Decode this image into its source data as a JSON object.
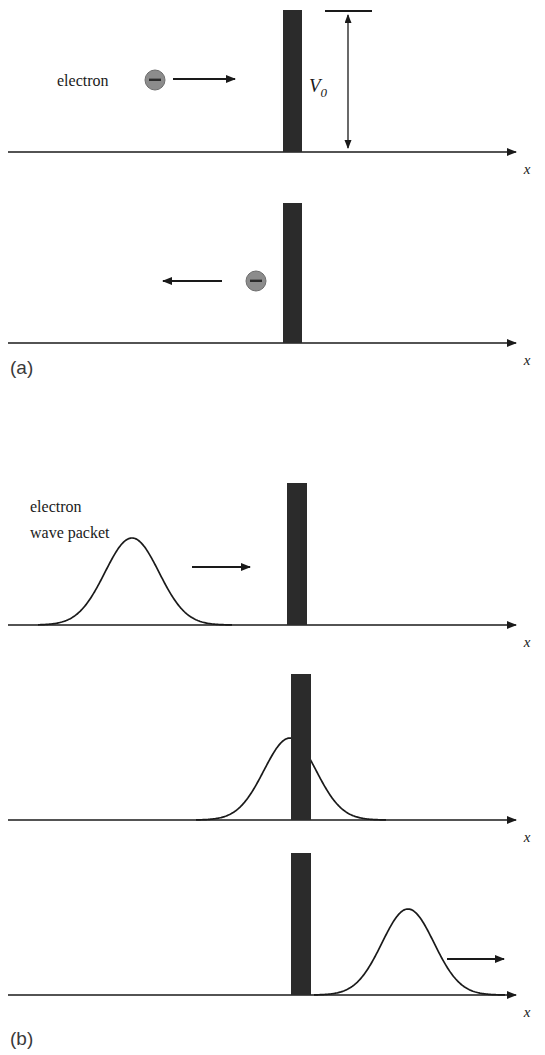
{
  "figure": {
    "colors": {
      "barrier": "#2b2b2b",
      "axis": "#1a1a1a",
      "curve": "#1a1a1a",
      "electron_fill": "#8c8c8c",
      "electron_stroke": "#6e6e6e",
      "electron_sign": "#2b2b2b",
      "panel_label": "#3a3a3a",
      "background": "#ffffff"
    },
    "panel_labels": [
      {
        "id": "a",
        "text": "(a)",
        "x": 10,
        "y": 373
      },
      {
        "id": "b",
        "text": "(b)",
        "x": 10,
        "y": 1044
      }
    ],
    "axis_label": "x",
    "panels": [
      {
        "name": "classical-incident",
        "axis_y": 152,
        "axis_x_start": 8,
        "axis_x_end": 524,
        "axis_label": "x",
        "axis_label_x": 527,
        "axis_label_y": 172,
        "barrier": {
          "x": 283,
          "y": 10,
          "width": 19,
          "height": 142
        },
        "particle": {
          "cx": 155,
          "cy": 80,
          "r": 10,
          "sign": "−"
        },
        "text_label": "electron",
        "text_label_x": 57,
        "text_label_y": 86,
        "arrow": {
          "x1": 173,
          "y1": 79,
          "x2": 243,
          "y2": 79,
          "direction": "right"
        },
        "measure": {
          "label": "V",
          "sublabel": "0",
          "label_x": 327,
          "label_y": 92,
          "line_x": 348,
          "top_y": 12,
          "bottom_y": 152,
          "tick_x1": 325,
          "tick_x2": 372,
          "tick_y": 11
        }
      },
      {
        "name": "classical-reflected",
        "axis_y": 343,
        "axis_x_start": 8,
        "axis_x_end": 524,
        "axis_label": "x",
        "axis_label_x": 527,
        "axis_label_y": 363,
        "barrier": {
          "x": 283,
          "y": 203,
          "width": 19,
          "height": 140
        },
        "particle": {
          "cx": 256,
          "cy": 281,
          "r": 10,
          "sign": "−"
        },
        "arrow": {
          "x1": 222,
          "y1": 281,
          "x2": 155,
          "y2": 281,
          "direction": "left"
        }
      },
      {
        "name": "wave-incident",
        "axis_y": 625,
        "axis_x_start": 8,
        "axis_x_end": 524,
        "axis_label": "x",
        "axis_label_x": 527,
        "axis_label_y": 645,
        "barrier": {
          "x": 287,
          "y": 483,
          "width": 20,
          "height": 142
        },
        "text_label_line1": "electron",
        "text_label_line2": "wave packet",
        "text_label_x": 30,
        "text_label_y1": 512,
        "text_label_y2": 538,
        "arrow": {
          "x1": 192,
          "y1": 567,
          "x2": 258,
          "y2": 567,
          "direction": "right"
        },
        "packet": {
          "center": 132,
          "sigma": 27,
          "amplitude": 87,
          "x_from": 38,
          "x_to": 232
        }
      },
      {
        "name": "wave-tunneling",
        "axis_y": 820,
        "axis_x_start": 8,
        "axis_x_end": 524,
        "axis_label": "x",
        "axis_label_x": 527,
        "axis_label_y": 840,
        "barrier": {
          "x": 291,
          "y": 674,
          "width": 20,
          "height": 146
        },
        "packet": {
          "center": 290,
          "sigma": 26,
          "amplitude": 82,
          "x_from": 196,
          "x_to": 386
        }
      },
      {
        "name": "wave-transmitted",
        "axis_y": 995,
        "axis_x_start": 8,
        "axis_x_end": 524,
        "axis_label": "x",
        "axis_label_x": 527,
        "axis_label_y": 1015,
        "barrier": {
          "x": 291,
          "y": 853,
          "width": 20,
          "height": 142
        },
        "arrow": {
          "x1": 447,
          "y1": 959,
          "x2": 512,
          "y2": 959,
          "direction": "right"
        },
        "packet": {
          "center": 408,
          "sigma": 26,
          "amplitude": 86,
          "x_from": 314,
          "x_to": 505
        }
      }
    ]
  },
  "chart_data": {
    "type": "line",
    "xlabel": "x",
    "ylabel": "",
    "barrier_height_label": "V0",
    "panels": [
      {
        "label": "(a) frame 1",
        "series": "classical particle",
        "particle_x": 155,
        "motion": "rightward",
        "barrier_x": 283
      },
      {
        "label": "(a) frame 2",
        "series": "classical particle",
        "particle_x": 256,
        "motion": "leftward",
        "barrier_x": 283
      },
      {
        "label": "(b) frame 1",
        "series": "gaussian wave packet",
        "peak_x": 132,
        "peak_height": 87,
        "sigma": 27,
        "motion": "rightward",
        "barrier_x": 287
      },
      {
        "label": "(b) frame 2",
        "series": "gaussian wave packet",
        "peak_x": 290,
        "peak_height": 82,
        "sigma": 26,
        "motion": "at barrier",
        "barrier_x": 291
      },
      {
        "label": "(b) frame 3",
        "series": "gaussian wave packet",
        "peak_x": 408,
        "peak_height": 86,
        "sigma": 26,
        "motion": "rightward",
        "barrier_x": 291
      }
    ]
  }
}
